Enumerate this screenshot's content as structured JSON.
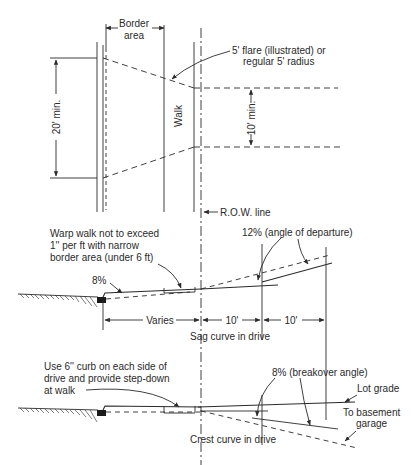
{
  "diagram": {
    "plan_view": {
      "border_area_label_line1": "Border",
      "border_area_label_line2": "area",
      "walk_label": "Walk",
      "driveway_width_label": "20' min.",
      "flare_label_line1": "5' flare (illustrated) or",
      "flare_label_line2": "regular 5' radius",
      "spacing_label": "10' min.",
      "row_label": "R.O.W. line"
    },
    "sag_profile": {
      "note_line1": "Warp walk not to exceed",
      "note_line2": "1'' per ft with narrow",
      "note_line3": "border area (under 6 ft)",
      "curb_grade_label": "8%",
      "departure_label": "12% (angle of departure)",
      "dim_varies": "Varies",
      "dim_1": "10'",
      "dim_2": "10'",
      "caption": "Sag curve in drive"
    },
    "crest_profile": {
      "note_line1": "Use 6'' curb on each side of",
      "note_line2": "drive and provide step-down",
      "note_line3": "at walk",
      "breakover_label": "8% (breakover angle)",
      "lot_grade_label": "Lot grade",
      "basement_label_line1": "To basement",
      "basement_label_line2": "garage",
      "caption": "Crest curve in drive"
    }
  }
}
